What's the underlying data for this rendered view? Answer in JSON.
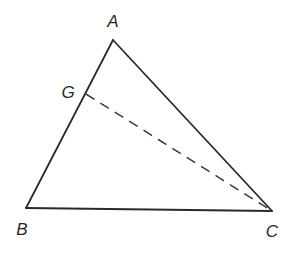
{
  "diagram": {
    "type": "geometry-triangle",
    "stroke_color": "#2a2a2a",
    "vertices": {
      "A": {
        "label": "A",
        "x": 113,
        "y": 40
      },
      "B": {
        "label": "B",
        "x": 26,
        "y": 208
      },
      "C": {
        "label": "C",
        "x": 272,
        "y": 211
      },
      "G": {
        "label": "G",
        "x": 86,
        "y": 94
      }
    },
    "segments": [
      {
        "from": "A",
        "to": "B",
        "style": "solid"
      },
      {
        "from": "B",
        "to": "C",
        "style": "solid"
      },
      {
        "from": "C",
        "to": "A",
        "style": "solid"
      },
      {
        "from": "G",
        "to": "C",
        "style": "dashed"
      }
    ],
    "labels": {
      "A": "A",
      "B": "B",
      "C": "C",
      "G": "G"
    }
  }
}
